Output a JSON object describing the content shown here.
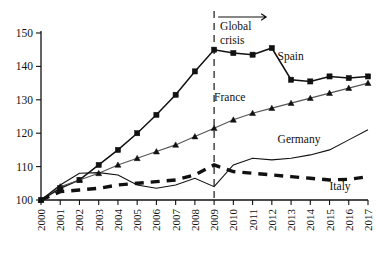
{
  "chart_data": {
    "type": "line",
    "title": "",
    "subtitle": "",
    "xlabel": "",
    "ylabel": "",
    "xlim": [
      2000,
      2017
    ],
    "ylim": [
      100,
      150
    ],
    "yticks": [
      100,
      110,
      120,
      130,
      140,
      150
    ],
    "grid": false,
    "legend_position": "inline-right-of-series",
    "x": [
      2000,
      2001,
      2002,
      2003,
      2004,
      2005,
      2006,
      2007,
      2008,
      2009,
      2010,
      2011,
      2012,
      2013,
      2014,
      2015,
      2016,
      2017
    ],
    "xtick_labels": [
      "2000",
      "2001",
      "2002",
      "2003",
      "2004",
      "2005",
      "2006",
      "2007",
      "2008",
      "2009",
      "2010",
      "2011",
      "2012",
      "2013",
      "2014",
      "2015",
      "2016",
      "2017"
    ],
    "series": [
      {
        "name": "Spain",
        "marker": "square",
        "style": "solid-thick",
        "values": [
          100.0,
          103.5,
          106.0,
          110.5,
          115.0,
          120.0,
          125.5,
          131.5,
          138.5,
          145.0,
          144.0,
          143.5,
          145.5,
          136.0,
          135.5,
          137.0,
          136.5,
          137.0
        ]
      },
      {
        "name": "France",
        "marker": "triangle",
        "style": "solid-thin",
        "values": [
          100.0,
          104.0,
          106.0,
          108.0,
          110.5,
          112.5,
          114.5,
          116.5,
          119.0,
          121.5,
          124.0,
          126.0,
          127.5,
          129.0,
          130.5,
          132.0,
          133.5,
          135.0
        ]
      },
      {
        "name": "Germany",
        "marker": "none",
        "style": "solid-thin",
        "values": [
          100.0,
          104.5,
          108.0,
          108.2,
          107.5,
          104.5,
          103.5,
          104.5,
          106.5,
          104.0,
          110.5,
          112.5,
          112.0,
          112.5,
          113.5,
          115.0,
          118.0,
          121.0
        ]
      },
      {
        "name": "Italy",
        "marker": "none",
        "style": "dashed-thick",
        "values": [
          100.0,
          102.5,
          103.0,
          103.5,
          104.5,
          105.0,
          105.5,
          106.0,
          107.5,
          110.5,
          108.5,
          108.0,
          107.5,
          107.0,
          106.5,
          106.0,
          106.2,
          107.0
        ]
      }
    ],
    "annotations": [
      {
        "text": "Global crisis",
        "type": "vertical-line-with-arrow",
        "at_x": 2009,
        "arrow_direction": "right"
      }
    ],
    "series_label_positions": [
      {
        "name": "Spain",
        "x": 2012.3,
        "y": 142.0
      },
      {
        "name": "France",
        "x": 2009.0,
        "y": 129.5
      },
      {
        "name": "Germany",
        "x": 2012.3,
        "y": 117.0
      },
      {
        "name": "Italy",
        "x": 2015.0,
        "y": 103.0
      }
    ]
  },
  "labels": {
    "spain": "Spain",
    "france": "France",
    "germany": "Germany",
    "italy": "Italy",
    "crisis_line1": "Global",
    "crisis_line2": "crisis"
  }
}
